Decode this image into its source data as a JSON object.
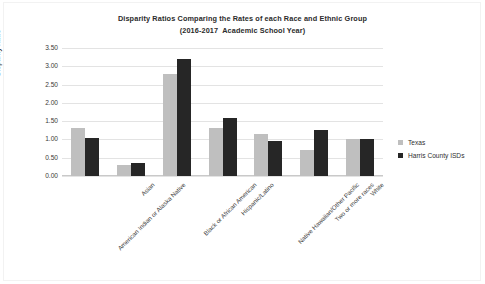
{
  "chart_data": {
    "type": "bar",
    "title": "Disparity Ratios Comparing the Rates of each Race and Ethnic Group",
    "subtitle": "(2016-2017  Academic School Year)",
    "xlabel": "",
    "ylabel": "Disparity Ratio",
    "ylim": [
      0,
      3.5
    ],
    "ytick_labels": [
      "3.50",
      "3.00",
      "2.50",
      "2.00",
      "1.50",
      "1.00",
      "0.50",
      "0.00"
    ],
    "ytick_values": [
      3.5,
      3.0,
      2.5,
      2.0,
      1.5,
      1.0,
      0.5,
      0.0
    ],
    "grid": true,
    "legend_position": "right",
    "categories": [
      "American Indian or Alaska Native",
      "Asian",
      "Black or African American",
      "Hispanic/Latino",
      "Native Hawaiian/Other Pacific",
      "Two or more races",
      "White"
    ],
    "series": [
      {
        "name": "Texas",
        "color": "#bfbfbf",
        "values": [
          1.3,
          0.3,
          2.8,
          1.3,
          1.15,
          0.7,
          1.0
        ]
      },
      {
        "name": "Harris County ISDs",
        "color": "#262626",
        "values": [
          1.05,
          0.35,
          3.2,
          1.6,
          0.95,
          1.25,
          1.0
        ]
      }
    ]
  }
}
